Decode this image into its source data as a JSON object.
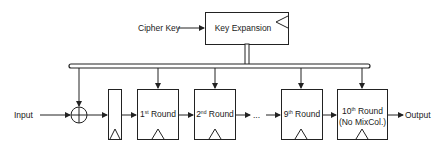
{
  "diagram": {
    "cipher_key_label": "Cipher Key",
    "key_expansion_label": "Key Expansion",
    "input_label": "Input",
    "output_label": "Output",
    "ellipsis": "...",
    "rounds": [
      {
        "num": "1",
        "sup": "st",
        "word": "Round"
      },
      {
        "num": "2",
        "sup": "nd",
        "word": "Round"
      },
      {
        "num": "9",
        "sup": "th",
        "word": "Round"
      },
      {
        "num": "10",
        "sup": "th",
        "word": "Round",
        "note": "(No MixCol.)"
      }
    ],
    "colors": {
      "stroke": "#222222",
      "bus_fill": "#bbbbbb",
      "background": "#ffffff"
    }
  }
}
